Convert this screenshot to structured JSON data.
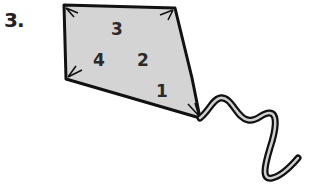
{
  "question": {
    "label": "3."
  },
  "kite": {
    "fill_color": "#d4d4d4",
    "outline_color": "#111111",
    "numbers": [
      {
        "text": "3",
        "x": 117,
        "y": 35
      },
      {
        "text": "4",
        "x": 99,
        "y": 66
      },
      {
        "text": "2",
        "x": 143,
        "y": 66
      },
      {
        "text": "1",
        "x": 161,
        "y": 96
      }
    ]
  }
}
